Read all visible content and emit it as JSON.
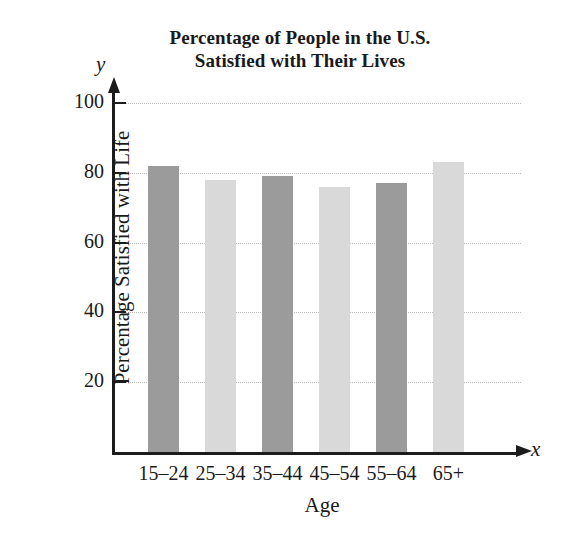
{
  "chart_data": {
    "type": "bar",
    "title": "Percentage of People in the U.S. Satisfied with Their Lives",
    "title_lines": [
      "Percentage of People in the U.S.",
      "Satisfied with Their Lives"
    ],
    "xlabel": "Age",
    "ylabel": "Percentage Satisfied with Life",
    "x_axis_letter": "x",
    "y_axis_letter": "y",
    "categories": [
      "15–24",
      "25–34",
      "35–44",
      "45–54",
      "55–64",
      "65+"
    ],
    "values": [
      82,
      78,
      79,
      76,
      77,
      83
    ],
    "ylim": [
      0,
      100
    ],
    "yticks": [
      20,
      40,
      60,
      80,
      100
    ],
    "ytick_labels": [
      "20",
      "40",
      "60",
      "80",
      "100"
    ],
    "grid": true,
    "grid_style": "dotted",
    "legend": "none",
    "bar_colors": [
      "#9b9b9b",
      "#d9d9d9",
      "#9b9b9b",
      "#d9d9d9",
      "#9b9b9b",
      "#d9d9d9"
    ],
    "colors": {
      "bar_dark": "#9b9b9b",
      "bar_light": "#d9d9d9",
      "axis": "#1c1c1c",
      "grid": "#b9b9b9",
      "text": "#1a1a1a",
      "background": "#ffffff"
    }
  }
}
